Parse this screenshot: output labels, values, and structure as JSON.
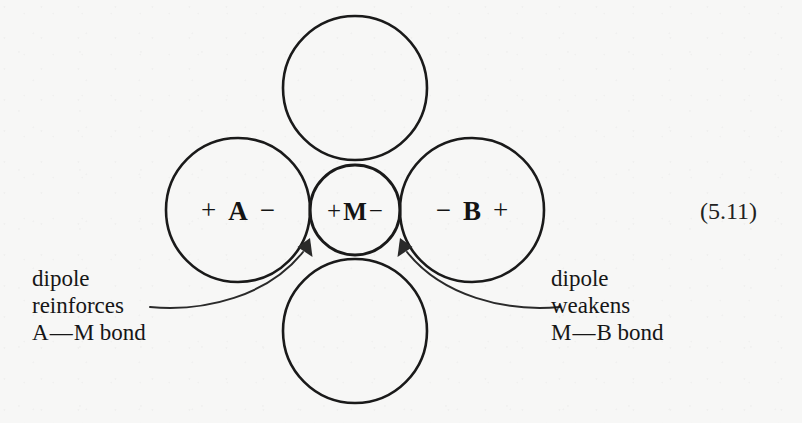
{
  "figure": {
    "equation_number": "(5.11)",
    "background_color": "#f7f7f6",
    "stroke_color": "#1a1a1a"
  },
  "atoms": {
    "left": {
      "name": "A",
      "left_sign": "+",
      "right_sign": "−",
      "cx": 238,
      "cy": 210,
      "r": 72
    },
    "center": {
      "name": "M",
      "left_sign": "+",
      "right_sign": "−",
      "cx": 355,
      "cy": 210,
      "r": 45
    },
    "right": {
      "name": "B",
      "left_sign": "−",
      "right_sign": "+",
      "cx": 472,
      "cy": 210,
      "r": 72
    },
    "top": {
      "name": "",
      "cx": 355,
      "cy": 88,
      "r": 72
    },
    "bottom": {
      "name": "",
      "cx": 355,
      "cy": 331,
      "r": 72
    }
  },
  "captions": {
    "left": {
      "line1": "dipole",
      "line2": "reinforces",
      "line3_pre": "A",
      "line3_dash": "—",
      "line3_post": "M bond"
    },
    "right": {
      "line1": "dipole",
      "line2": "weakens",
      "line3_pre": "M",
      "line3_dash": "—",
      "line3_post": "B bond"
    }
  },
  "annotations": {
    "left_arrow_name": "left-dipole-arrow",
    "right_arrow_name": "right-dipole-arrow"
  }
}
